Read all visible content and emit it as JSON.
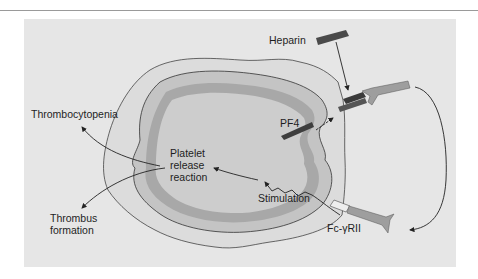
{
  "figure": {
    "labels": {
      "heparin": "Heparin",
      "pf4": "PF4",
      "thrombocytopenia": "Thrombocytopenia",
      "platelet_release_reaction": [
        "Platelet",
        "release",
        "reaction"
      ],
      "stimulation": "Stimulation",
      "thrombus_formation": [
        "Thrombus",
        "formation"
      ],
      "fc_receptor": "Fc-γRII"
    },
    "colors": {
      "panel_bg": "#e6e6e6",
      "cell_fill": "#cfcfcf",
      "granule_band": "#b0b0b0",
      "outer_membrane": "#dcdcdc",
      "heparin_bar": "#4a4a4a",
      "antibody": "#9e9e9e",
      "line": "#333333"
    }
  }
}
